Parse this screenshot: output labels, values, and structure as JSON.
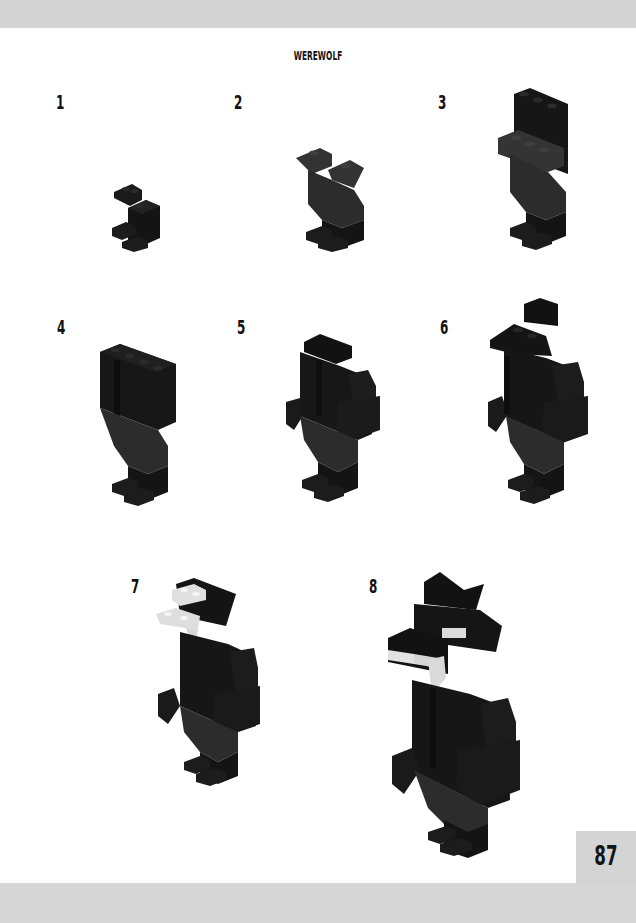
{
  "page": {
    "title": "WEREWOLF",
    "page_number": "87"
  },
  "steps": [
    {
      "number": "1",
      "description": "Two dark bricks forming feet base"
    },
    {
      "number": "2",
      "description": "Legs added with angled slopes"
    },
    {
      "number": "3",
      "description": "Upper body brick added"
    },
    {
      "number": "4",
      "description": "Torso widened"
    },
    {
      "number": "5",
      "description": "Arms added"
    },
    {
      "number": "6",
      "description": "Shoulders and head base added"
    },
    {
      "number": "7",
      "description": "White jaw plates and fangs added"
    },
    {
      "number": "8",
      "description": "Ears and eyes completed"
    }
  ],
  "colors": {
    "brick_dark": "#141414",
    "brick_mid": "#262626",
    "brick_legs": "#2c2c2c",
    "fang_white": "#e8e8e8",
    "band_gray": "#d3d3d3"
  }
}
